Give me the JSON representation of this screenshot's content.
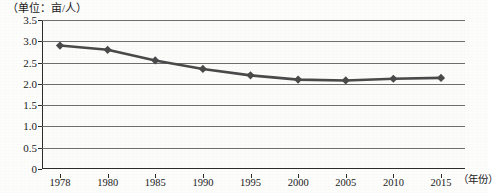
{
  "unit_caption": "（单位：亩/人）",
  "chart_data": {
    "type": "line",
    "title": "",
    "subtitle": "",
    "unit_note": "（单位：亩/人）",
    "xlabel": "（年份）",
    "ylabel": "",
    "categories": [
      "1978",
      "1980",
      "1985",
      "1990",
      "1995",
      "2000",
      "2005",
      "2010",
      "2015"
    ],
    "values": [
      2.9,
      2.8,
      2.55,
      2.35,
      2.2,
      2.1,
      2.08,
      2.12,
      2.14
    ],
    "series": [
      {
        "name": "人均耕地面积",
        "values": [
          2.9,
          2.8,
          2.55,
          2.35,
          2.2,
          2.1,
          2.08,
          2.12,
          2.14
        ]
      }
    ],
    "ylim": [
      0,
      3.5
    ],
    "yticks": [
      0,
      0.5,
      1.0,
      1.5,
      2.0,
      2.5,
      3.0,
      3.5
    ],
    "ytick_labels": [
      "0",
      "0.5",
      "1.0",
      "1.5",
      "2.0",
      "2.5",
      "3.0",
      "3.5"
    ],
    "grid": true,
    "grid_axis": "y",
    "legend": false,
    "legend_position": "none",
    "marker": "diamond",
    "line_color": "#4a4a4a",
    "marker_color": "#4a4a4a",
    "grid_color": "#6f6f6f",
    "axis_color": "#2b2b2b",
    "background_color": "#fcfcfb"
  }
}
